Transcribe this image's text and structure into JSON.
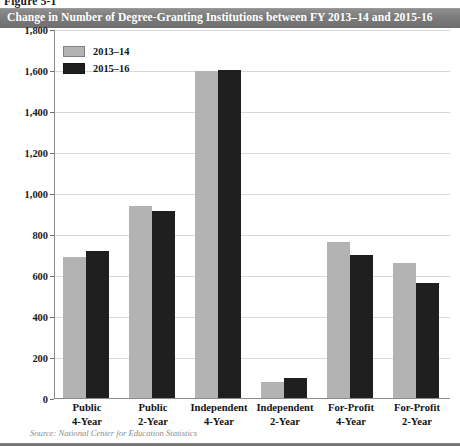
{
  "figure": {
    "number": "Figure 5-1",
    "title": "Change in Number of Degree-Granting Institutions between FY 2013–14 and 2015-16",
    "source": "Source: National Center for Education Statistics"
  },
  "colors": {
    "series_2013_14": "#b3b3b3",
    "series_2015_16": "#1f1f1f",
    "title_bar": "#7b7b7b",
    "gridline": "#d8d8d8",
    "axis": "#8a8a8a"
  },
  "legend": {
    "position": "top-left",
    "items": [
      {
        "label": "2013–14",
        "color": "#b3b3b3"
      },
      {
        "label": "2015–16",
        "color": "#1f1f1f"
      }
    ]
  },
  "chart_data": {
    "type": "bar",
    "title": "Change in Number of Degree-Granting Institutions between FY 2013–14 and 2015-16",
    "xlabel": "",
    "ylabel": "",
    "ylim": [
      0,
      1800
    ],
    "ytick_step": 200,
    "yticks": [
      0,
      200,
      400,
      600,
      800,
      1000,
      1200,
      1400,
      1600,
      1800
    ],
    "ytick_labels": [
      "0",
      "200",
      "400",
      "600",
      "800",
      "1,000",
      "1,200",
      "1,400",
      "1,600",
      "1,800"
    ],
    "grid": true,
    "legend_position": "top-left",
    "categories": [
      "Public 4-Year",
      "Public 2-Year",
      "Independent 4-Year",
      "Independent 2-Year",
      "For-Profit 4-Year",
      "For-Profit 2-Year"
    ],
    "category_lines": [
      [
        "Public",
        "4-Year"
      ],
      [
        "Public",
        "2-Year"
      ],
      [
        "Independent",
        "4-Year"
      ],
      [
        "Independent",
        "2-Year"
      ],
      [
        "For-Profit",
        "4-Year"
      ],
      [
        "For-Profit",
        "2-Year"
      ]
    ],
    "series": [
      {
        "name": "2013–14",
        "color": "#b3b3b3",
        "values": [
          690,
          935,
          1595,
          80,
          760,
          660
        ]
      },
      {
        "name": "2015–16",
        "color": "#1f1f1f",
        "values": [
          715,
          912,
          1600,
          100,
          700,
          560
        ]
      }
    ]
  }
}
